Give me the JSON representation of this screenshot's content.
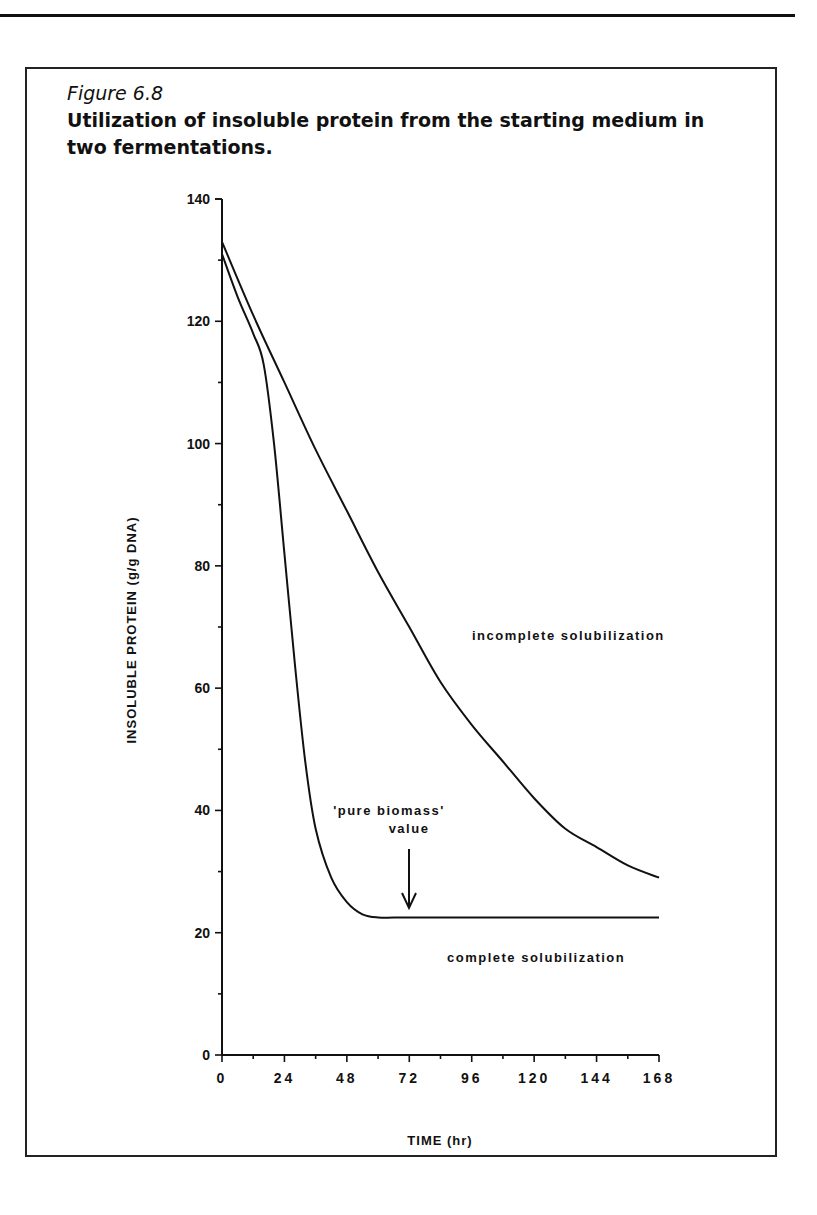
{
  "figure": {
    "number": "Figure 6.8",
    "title": "Utilization of insoluble protein from the starting medium in two fermentations."
  },
  "chart_data": {
    "type": "line",
    "title": "Utilization of insoluble protein from the starting medium in two fermentations.",
    "xlabel": "TIME (hr)",
    "ylabel": "INSOLUBLE PROTEIN (g/g DNA)",
    "xlim": [
      0,
      168
    ],
    "ylim": [
      0,
      140
    ],
    "x_ticks": [
      0,
      24,
      48,
      72,
      96,
      120,
      144,
      168
    ],
    "y_ticks": [
      0,
      20,
      40,
      60,
      80,
      100,
      120,
      140
    ],
    "grid": false,
    "legend": "none (direct labels)",
    "series": [
      {
        "name": "incomplete solubilization",
        "x": [
          0,
          12,
          24,
          36,
          48,
          60,
          72,
          84,
          96,
          108,
          120,
          132,
          144,
          156,
          168
        ],
        "values": [
          133,
          121,
          110,
          99,
          89,
          79,
          70,
          61,
          54,
          48,
          42,
          37,
          34,
          31,
          29
        ]
      },
      {
        "name": "complete solubilization",
        "x": [
          0,
          6,
          12,
          16,
          20,
          24,
          28,
          32,
          36,
          42,
          48,
          54,
          60,
          72,
          96,
          120,
          144,
          168
        ],
        "values": [
          131,
          124,
          118,
          113,
          100,
          82,
          64,
          48,
          37,
          29,
          25,
          23,
          22.5,
          22.5,
          22.5,
          22.5,
          22.5,
          22.5
        ]
      }
    ],
    "annotations": [
      {
        "text": "'pure biomass' value",
        "x": 72,
        "y": 22.5,
        "type": "arrow-down"
      },
      {
        "text": "incomplete solubilization",
        "x": 96,
        "y": 69
      },
      {
        "text": "complete solubilization",
        "x": 96,
        "y": 15
      }
    ]
  },
  "labels": {
    "y_axis_title": "INSOLUBLE PROTEIN  (g/g  DNA)",
    "x_axis_title": "TIME  (hr)",
    "incomplete": "incomplete  solubilization",
    "complete": "complete  solubilization",
    "pure_biomass_line1": "'pure  biomass'",
    "pure_biomass_line2": "value"
  }
}
